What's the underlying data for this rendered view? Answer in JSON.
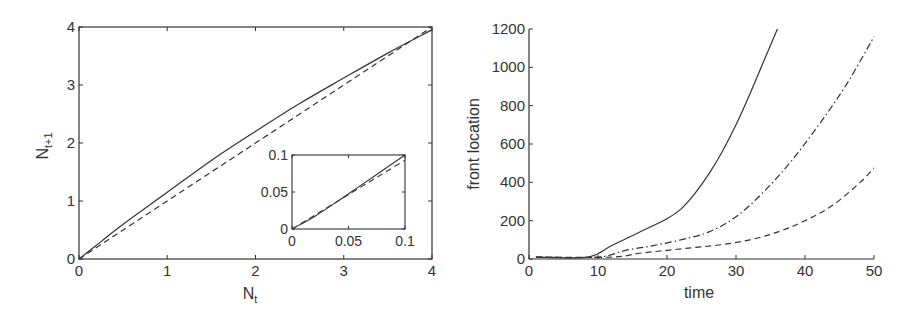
{
  "chart_data": [
    {
      "type": "line",
      "title": "",
      "xlabel": "N_t",
      "ylabel": "N_{t+1}",
      "xlabel_main": "N",
      "xlabel_sub": "t",
      "ylabel_main": "N",
      "ylabel_sub": "t+1",
      "xlim": [
        0,
        4
      ],
      "ylim": [
        0,
        4
      ],
      "xticks": [
        0,
        1,
        2,
        3,
        4
      ],
      "yticks": [
        0,
        1,
        2,
        3,
        4
      ],
      "grid": false,
      "box": true,
      "series": [
        {
          "name": "map",
          "style": "solid",
          "x": [
            0,
            0.25,
            0.5,
            1.0,
            1.5,
            2.0,
            2.5,
            3.0,
            3.5,
            4.0
          ],
          "y": [
            0,
            0.3,
            0.6,
            1.15,
            1.7,
            2.2,
            2.68,
            3.12,
            3.55,
            3.95
          ]
        },
        {
          "name": "identity",
          "style": "dashed",
          "x": [
            0,
            4
          ],
          "y": [
            0,
            4
          ]
        }
      ],
      "inset": {
        "xlim": [
          0,
          0.1
        ],
        "ylim": [
          0,
          0.1
        ],
        "xticks": [
          0,
          0.05,
          0.1
        ],
        "yticks": [
          0,
          0.05,
          0.1
        ],
        "xtick_labels": [
          "0",
          "0.05",
          "0.1"
        ],
        "ytick_labels": [
          "0",
          "0.05",
          "0.1"
        ],
        "series": [
          {
            "name": "map",
            "style": "solid",
            "x": [
              0,
              0.02,
              0.04,
              0.06,
              0.08,
              0.1
            ],
            "y": [
              0,
              0.017,
              0.037,
              0.058,
              0.079,
              0.1
            ]
          },
          {
            "name": "identity",
            "style": "dashed",
            "x": [
              0,
              0.1
            ],
            "y": [
              0,
              0.093
            ]
          }
        ]
      }
    },
    {
      "type": "line",
      "title": "",
      "xlabel": "time",
      "ylabel": "front location",
      "xlim": [
        0,
        50
      ],
      "ylim": [
        0,
        1200
      ],
      "xticks": [
        0,
        10,
        20,
        30,
        40,
        50
      ],
      "yticks": [
        0,
        200,
        400,
        600,
        800,
        1000,
        1200
      ],
      "grid": false,
      "box": false,
      "series": [
        {
          "name": "solid",
          "style": "solid",
          "x": [
            1,
            8.5,
            12,
            16,
            20,
            22,
            24,
            26,
            28,
            30,
            32,
            34,
            36
          ],
          "y": [
            10,
            10,
            70,
            140,
            210,
            260,
            340,
            440,
            560,
            700,
            860,
            1030,
            1200
          ]
        },
        {
          "name": "dash-dot",
          "style": "dashdot",
          "x": [
            1,
            10,
            14,
            18,
            22,
            26,
            30,
            34,
            38,
            42,
            46,
            50
          ],
          "y": [
            10,
            10,
            45,
            70,
            100,
            140,
            220,
            350,
            510,
            700,
            910,
            1160
          ]
        },
        {
          "name": "dashed",
          "style": "dashed",
          "x": [
            1,
            12,
            16,
            20,
            24,
            28,
            32,
            36,
            40,
            44,
            48,
            50
          ],
          "y": [
            10,
            10,
            30,
            45,
            60,
            75,
            100,
            140,
            200,
            280,
            400,
            475
          ]
        }
      ]
    }
  ]
}
